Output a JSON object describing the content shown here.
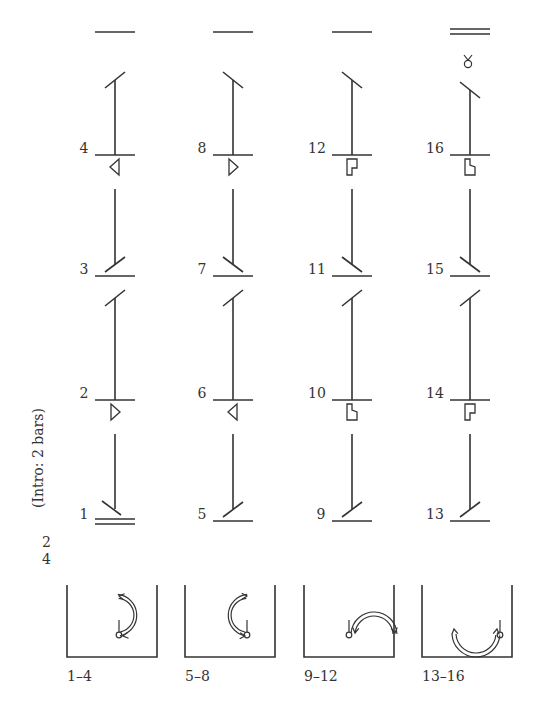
{
  "diagram": {
    "type": "movement-notation-score",
    "side_label": "(Intro: 2 bars)",
    "meter": {
      "top": "2",
      "bottom": "4"
    },
    "columns": [
      {
        "x": 115,
        "bars": [
          {
            "number": "1",
            "y": 521,
            "double": true
          },
          {
            "number": "2",
            "y": 400,
            "symbol": "triangle-right"
          },
          {
            "number": "3",
            "y": 276
          },
          {
            "number": "4",
            "y": 155,
            "symbol": "triangle-left"
          }
        ],
        "top_line": {
          "y": 32,
          "double": false
        },
        "floorplan_label": "1–4",
        "floorplan": "clockwise-arc-right"
      },
      {
        "x": 233,
        "bars": [
          {
            "number": "5",
            "y": 521
          },
          {
            "number": "6",
            "y": 400,
            "symbol": "triangle-left"
          },
          {
            "number": "7",
            "y": 276
          },
          {
            "number": "8",
            "y": 155,
            "symbol": "triangle-right"
          }
        ],
        "top_line": {
          "y": 32,
          "double": false
        },
        "floorplan_label": "5–8",
        "floorplan": "counterclockwise-arc-left"
      },
      {
        "x": 352,
        "bars": [
          {
            "number": "9",
            "y": 521
          },
          {
            "number": "10",
            "y": 400,
            "symbol": "pin-b"
          },
          {
            "number": "11",
            "y": 276
          },
          {
            "number": "12",
            "y": 155,
            "symbol": "pin-p"
          }
        ],
        "top_line": {
          "y": 32,
          "double": false
        },
        "floorplan_label": "9–12",
        "floorplan": "arc-over-right"
      },
      {
        "x": 470,
        "bars": [
          {
            "number": "13",
            "y": 521
          },
          {
            "number": "14",
            "y": 400,
            "symbol": "pin-p"
          },
          {
            "number": "15",
            "y": 276
          },
          {
            "number": "16",
            "y": 155,
            "symbol": "pin-b"
          }
        ],
        "top_line": {
          "y": 32,
          "double": true
        },
        "end_symbol": "hold-sign",
        "floorplan_label": "13–16",
        "floorplan": "arc-under-left"
      }
    ]
  }
}
